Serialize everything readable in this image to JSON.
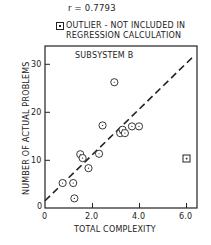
{
  "chart_data": {
    "type": "scatter",
    "title": "SUBSYSTEM B",
    "annotation_r": "r = 0.7793",
    "legend": "OUTLIER - NOT INCLUDED IN REGRESSION CALCULATION",
    "legend_line1": "OUTLIER - NOT INCLUDED IN",
    "legend_line2": "REGRESSION CALCULATION",
    "xlabel": "TOTAL COMPLEXITY",
    "ylabel": "NUMBER OF ACTUAL PROBLEMS",
    "xlim": [
      0,
      6.4
    ],
    "ylim": [
      0,
      33
    ],
    "xticks": [
      "0",
      "2.0",
      "4.0",
      "6.0"
    ],
    "yticks": [
      "0",
      "10",
      "20",
      "30"
    ],
    "grid": false,
    "points": [
      {
        "x": 0.75,
        "y": 5.2
      },
      {
        "x": 1.2,
        "y": 5.2
      },
      {
        "x": 1.25,
        "y": 2.0
      },
      {
        "x": 1.5,
        "y": 11.2
      },
      {
        "x": 1.6,
        "y": 10.4
      },
      {
        "x": 1.85,
        "y": 8.3
      },
      {
        "x": 2.3,
        "y": 11.3
      },
      {
        "x": 2.45,
        "y": 17.2
      },
      {
        "x": 2.95,
        "y": 26.2
      },
      {
        "x": 3.2,
        "y": 15.6
      },
      {
        "x": 3.3,
        "y": 16.3
      },
      {
        "x": 3.4,
        "y": 15.6
      },
      {
        "x": 3.7,
        "y": 17.0
      },
      {
        "x": 4.0,
        "y": 17.0
      }
    ],
    "outlier": {
      "x": 6.0,
      "y": 10.3
    },
    "regression_line": {
      "x0": 0,
      "y0": 1.5,
      "x1": 6.3,
      "y1": 31.5,
      "style": "dashed"
    }
  }
}
